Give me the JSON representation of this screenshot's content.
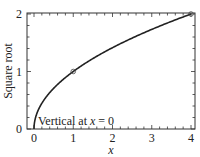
{
  "chart_data": {
    "type": "line",
    "title": "",
    "xlabel": "x",
    "ylabel": "Square root",
    "xlim": [
      -0.18,
      4.1
    ],
    "ylim": [
      0,
      2.03
    ],
    "grid": false,
    "x_ticks": [
      0,
      1,
      2,
      3,
      4
    ],
    "x_tick_labels": [
      "0",
      "1",
      "2",
      "3",
      "4"
    ],
    "y_ticks": [
      0,
      1,
      2
    ],
    "y_tick_labels": [
      "0",
      "1",
      "2"
    ],
    "minor_tick_step": 0.2,
    "series": [
      {
        "name": "sqrt(x)",
        "function": "y = sqrt(x)",
        "x": [
          0,
          0.01,
          0.05,
          0.1,
          0.2,
          0.3,
          0.5,
          0.75,
          1,
          1.5,
          2,
          2.5,
          3,
          3.5,
          4
        ],
        "values": [
          0,
          0.1,
          0.224,
          0.316,
          0.447,
          0.548,
          0.707,
          0.866,
          1,
          1.225,
          1.414,
          1.581,
          1.732,
          1.871,
          2
        ],
        "color": "#222222"
      }
    ],
    "markers": [
      {
        "x": 1,
        "y": 1,
        "shape": "open-circle"
      },
      {
        "x": 4,
        "y": 2,
        "shape": "open-circle"
      }
    ],
    "annotations": [
      {
        "text_prefix": "Vertical at ",
        "text_var": "x",
        "text_suffix": " = 0",
        "x": 0.1,
        "y": 0.1
      }
    ],
    "legend": null
  }
}
